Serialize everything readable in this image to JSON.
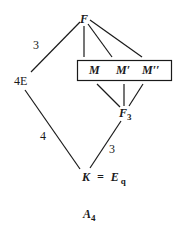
{
  "nodes": {
    "top": "F",
    "left": "4E",
    "box_m1": "M",
    "box_m2": "M′",
    "box_m3": "M′′",
    "mid_right": "F",
    "mid_right_sub": "3",
    "bottom": "K = E",
    "bottom_sub": "q"
  },
  "edge_labels": {
    "top_left": "3",
    "left_bottom": "4",
    "mid_bottom": "3"
  },
  "caption": {
    "text": "A",
    "sub": "4"
  },
  "colors": {
    "line": "#1a1a1a",
    "background": "#ffffff"
  }
}
